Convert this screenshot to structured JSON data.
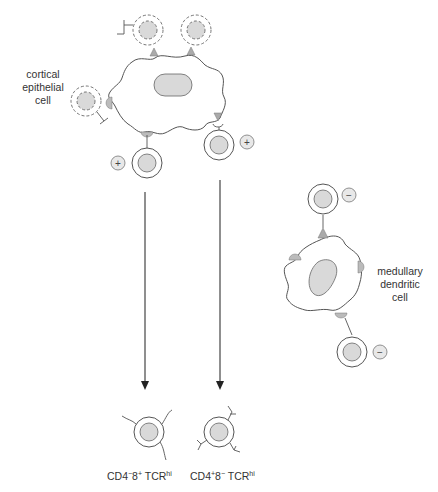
{
  "labels": {
    "cortical": [
      "cortical",
      "epithelial",
      "cell"
    ],
    "medullary": [
      "medullary",
      "dendritic",
      "cell"
    ]
  },
  "captions": {
    "left": {
      "base1": "CD4",
      "sup1": "−",
      "base2": "8",
      "sup2": "+",
      "base3": " TCR",
      "sup3": "hi"
    },
    "right": {
      "base1": "CD4",
      "sup1": "+",
      "base2": "8",
      "sup2": "−",
      "base3": " TCR",
      "sup3": "hi"
    }
  },
  "signs": {
    "positive": "+",
    "negative": "−"
  },
  "colors": {
    "stroke": "#555555",
    "fill_gray": "#d9d9d9",
    "receptor_gray": "#bbbbbb"
  }
}
